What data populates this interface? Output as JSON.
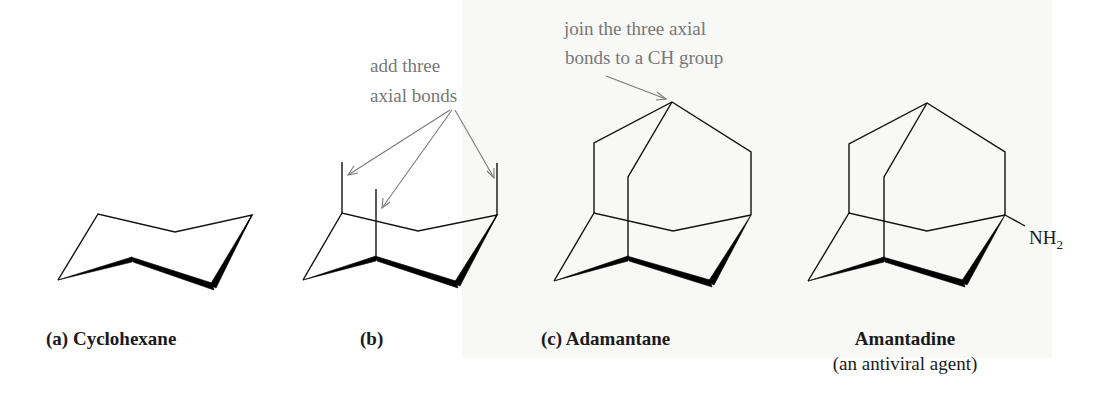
{
  "figure": {
    "annotations": {
      "add_axial": [
        "add three",
        "axial bonds"
      ],
      "join_axial": [
        "join the three axial",
        "bonds to a CH group"
      ]
    },
    "panels": [
      {
        "id": "a",
        "prefix": "(a)",
        "name": "Cyclohexane"
      },
      {
        "id": "b",
        "prefix": "(b)",
        "name": ""
      },
      {
        "id": "c",
        "prefix": "(c)",
        "name": "Adamantane"
      },
      {
        "id": "amantadine",
        "prefix": "",
        "name": "Amantadine",
        "subtitle": "(an antiviral agent)"
      }
    ],
    "substituent": {
      "main": "NH",
      "subscript": "2"
    },
    "colors": {
      "bond": "#111111",
      "annotation_text": "#777777",
      "label_text": "#1a1a1a",
      "panel_background": "#f8f8f7"
    }
  }
}
